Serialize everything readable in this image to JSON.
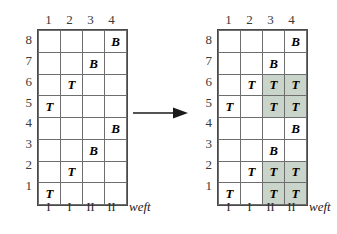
{
  "figure": {
    "type": "weaving-draft-transformation",
    "panels": [
      {
        "id": "before",
        "column_headers": [
          "1",
          "2",
          "3",
          "4"
        ],
        "row_headers": [
          "8",
          "7",
          "6",
          "5",
          "4",
          "3",
          "2",
          "1"
        ],
        "weft_labels": [
          "I",
          "I",
          "II",
          "II"
        ],
        "weft_caption": "weft",
        "rows": [
          {
            "row": "8",
            "cells": [
              {
                "text": "",
                "shaded": false
              },
              {
                "text": "",
                "shaded": false
              },
              {
                "text": "",
                "shaded": false
              },
              {
                "text": "B",
                "shaded": false
              }
            ]
          },
          {
            "row": "7",
            "cells": [
              {
                "text": "",
                "shaded": false
              },
              {
                "text": "",
                "shaded": false
              },
              {
                "text": "B",
                "shaded": false
              },
              {
                "text": "",
                "shaded": false
              }
            ]
          },
          {
            "row": "6",
            "cells": [
              {
                "text": "",
                "shaded": false
              },
              {
                "text": "T",
                "shaded": false
              },
              {
                "text": "",
                "shaded": false
              },
              {
                "text": "",
                "shaded": false
              }
            ]
          },
          {
            "row": "5",
            "cells": [
              {
                "text": "T",
                "shaded": false
              },
              {
                "text": "",
                "shaded": false
              },
              {
                "text": "",
                "shaded": false
              },
              {
                "text": "",
                "shaded": false
              }
            ]
          },
          {
            "row": "4",
            "cells": [
              {
                "text": "",
                "shaded": false
              },
              {
                "text": "",
                "shaded": false
              },
              {
                "text": "",
                "shaded": false
              },
              {
                "text": "B",
                "shaded": false
              }
            ]
          },
          {
            "row": "3",
            "cells": [
              {
                "text": "",
                "shaded": false
              },
              {
                "text": "",
                "shaded": false
              },
              {
                "text": "B",
                "shaded": false
              },
              {
                "text": "",
                "shaded": false
              }
            ]
          },
          {
            "row": "2",
            "cells": [
              {
                "text": "",
                "shaded": false
              },
              {
                "text": "T",
                "shaded": false
              },
              {
                "text": "",
                "shaded": false
              },
              {
                "text": "",
                "shaded": false
              }
            ]
          },
          {
            "row": "1",
            "cells": [
              {
                "text": "T",
                "shaded": false
              },
              {
                "text": "",
                "shaded": false
              },
              {
                "text": "",
                "shaded": false
              },
              {
                "text": "",
                "shaded": false
              }
            ]
          }
        ]
      },
      {
        "id": "after",
        "column_headers": [
          "1",
          "2",
          "3",
          "4"
        ],
        "row_headers": [
          "8",
          "7",
          "6",
          "5",
          "4",
          "3",
          "2",
          "1"
        ],
        "weft_labels": [
          "I",
          "I",
          "II",
          "II"
        ],
        "weft_caption": "weft",
        "rows": [
          {
            "row": "8",
            "cells": [
              {
                "text": "",
                "shaded": false
              },
              {
                "text": "",
                "shaded": false
              },
              {
                "text": "",
                "shaded": false
              },
              {
                "text": "B",
                "shaded": false
              }
            ]
          },
          {
            "row": "7",
            "cells": [
              {
                "text": "",
                "shaded": false
              },
              {
                "text": "",
                "shaded": false
              },
              {
                "text": "B",
                "shaded": false
              },
              {
                "text": "",
                "shaded": false
              }
            ]
          },
          {
            "row": "6",
            "cells": [
              {
                "text": "",
                "shaded": false
              },
              {
                "text": "T",
                "shaded": false
              },
              {
                "text": "T",
                "shaded": true
              },
              {
                "text": "T",
                "shaded": true
              }
            ]
          },
          {
            "row": "5",
            "cells": [
              {
                "text": "T",
                "shaded": false
              },
              {
                "text": "",
                "shaded": false
              },
              {
                "text": "T",
                "shaded": true
              },
              {
                "text": "T",
                "shaded": true
              }
            ]
          },
          {
            "row": "4",
            "cells": [
              {
                "text": "",
                "shaded": false
              },
              {
                "text": "",
                "shaded": false
              },
              {
                "text": "",
                "shaded": false
              },
              {
                "text": "B",
                "shaded": false
              }
            ]
          },
          {
            "row": "3",
            "cells": [
              {
                "text": "",
                "shaded": false
              },
              {
                "text": "",
                "shaded": false
              },
              {
                "text": "B",
                "shaded": false
              },
              {
                "text": "",
                "shaded": false
              }
            ]
          },
          {
            "row": "2",
            "cells": [
              {
                "text": "",
                "shaded": false
              },
              {
                "text": "T",
                "shaded": false
              },
              {
                "text": "T",
                "shaded": true
              },
              {
                "text": "T",
                "shaded": true
              }
            ]
          },
          {
            "row": "1",
            "cells": [
              {
                "text": "T",
                "shaded": false
              },
              {
                "text": "",
                "shaded": false
              },
              {
                "text": "T",
                "shaded": true
              },
              {
                "text": "T",
                "shaded": true
              }
            ]
          }
        ]
      }
    ],
    "arrow": {
      "direction": "right",
      "label": ""
    },
    "colors": {
      "shaded_cell": "#c9d4cb",
      "grid_line": "#6e6e6e",
      "grid_border": "#4a4a4a",
      "text": "#000000",
      "background": "#ffffff"
    }
  }
}
